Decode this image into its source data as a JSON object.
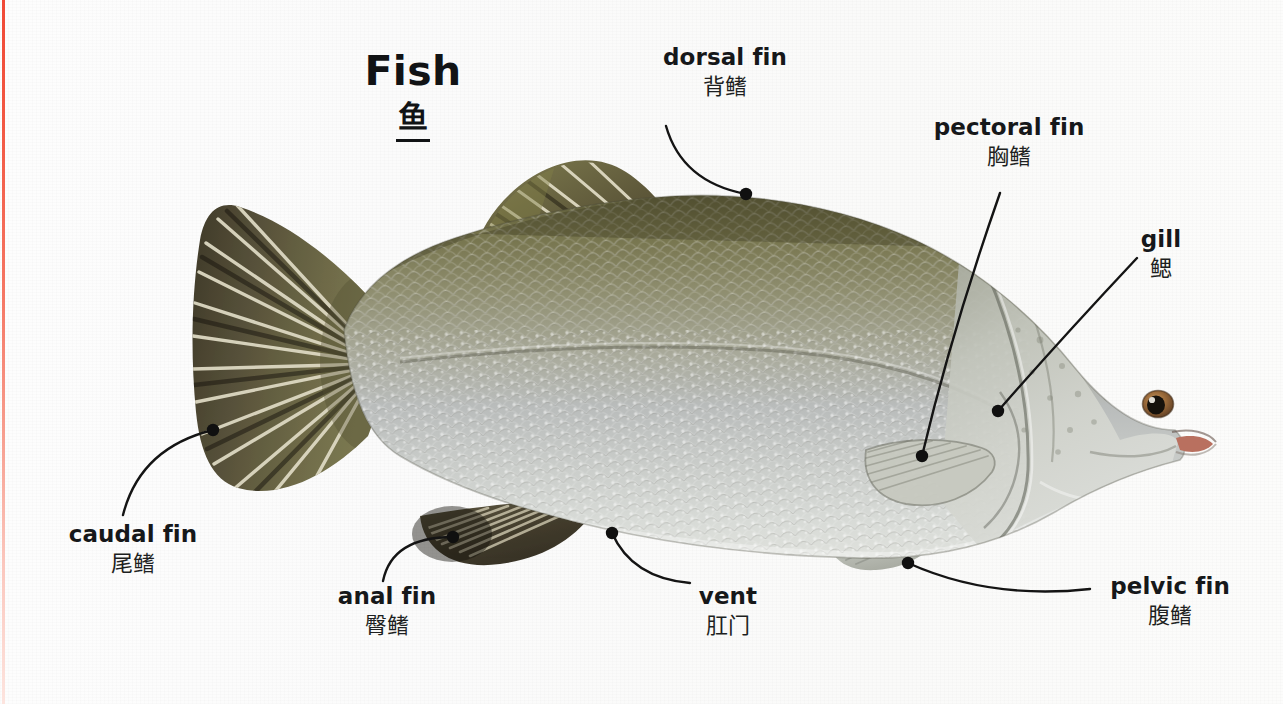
{
  "page": {
    "background_color": "#fbfbfa",
    "margin_stripe_color": "#f0402c",
    "text_color": "#16181a",
    "leader_color": "#141414"
  },
  "title": {
    "english": "Fish",
    "chinese": "鱼"
  },
  "subject": {
    "name": "fish-illustration",
    "description": "Side view illustration of a barramundi-like fish facing right",
    "colors": {
      "dorsal_olive": "#6d6a43",
      "body_olive": "#8b8a6d",
      "body_silver": "#b9bcbb",
      "belly_pale": "#d9dcda",
      "head_pale": "#c9ccc7",
      "fin_dark": "#4a4534",
      "fin_ray_light": "#ded9c4",
      "eye_iris": "#9a6a3a",
      "eye_pupil": "#14100c",
      "mouth_pink": "#b9705f"
    }
  },
  "labels": [
    {
      "id": "dorsal-fin",
      "english": "dorsal fin",
      "chinese": "背鳍",
      "align": "center",
      "text_x": 663,
      "text_y": 44,
      "text_width": 124,
      "leader_start": {
        "x": 666,
        "y": 126
      },
      "leader_ctrl": {
        "x": 682,
        "y": 182
      },
      "leader_end": {
        "x": 746,
        "y": 194
      }
    },
    {
      "id": "pectoral-fin",
      "english": "pectoral fin",
      "chinese": "胸鳍",
      "align": "center",
      "text_x": 932,
      "text_y": 114,
      "text_width": 154,
      "leader_start": {
        "x": 1000,
        "y": 193
      },
      "leader_ctrl": {
        "x": 952,
        "y": 330
      },
      "leader_end": {
        "x": 922,
        "y": 456
      }
    },
    {
      "id": "gill",
      "english": "gill",
      "chinese": "鳃",
      "align": "center",
      "text_x": 1124,
      "text_y": 226,
      "text_width": 74,
      "leader_start": {
        "x": 1137,
        "y": 258
      },
      "leader_ctrl": {
        "x": 1060,
        "y": 340
      },
      "leader_end": {
        "x": 998,
        "y": 411
      }
    },
    {
      "id": "caudal-fin",
      "english": "caudal fin",
      "chinese": "尾鳍",
      "align": "center",
      "text_x": 66,
      "text_y": 521,
      "text_width": 134,
      "leader_start": {
        "x": 123,
        "y": 515
      },
      "leader_ctrl": {
        "x": 140,
        "y": 448
      },
      "leader_end": {
        "x": 213,
        "y": 430
      }
    },
    {
      "id": "anal-fin",
      "english": "anal fin",
      "chinese": "臀鳍",
      "align": "center",
      "text_x": 330,
      "text_y": 583,
      "text_width": 114,
      "leader_start": {
        "x": 383,
        "y": 581
      },
      "leader_ctrl": {
        "x": 392,
        "y": 537
      },
      "leader_end": {
        "x": 453,
        "y": 537
      }
    },
    {
      "id": "vent",
      "english": "vent",
      "chinese": "肛门",
      "align": "center",
      "text_x": 682,
      "text_y": 583,
      "text_width": 92,
      "leader_start": {
        "x": 690,
        "y": 583
      },
      "leader_ctrl": {
        "x": 632,
        "y": 578
      },
      "leader_end": {
        "x": 612,
        "y": 533
      }
    },
    {
      "id": "pelvic-fin",
      "english": "pelvic fin",
      "chinese": "腹鳍",
      "align": "center",
      "text_x": 1106,
      "text_y": 573,
      "text_width": 128,
      "leader_start": {
        "x": 1090,
        "y": 589
      },
      "leader_ctrl": {
        "x": 990,
        "y": 600
      },
      "leader_end": {
        "x": 908,
        "y": 563
      }
    }
  ]
}
